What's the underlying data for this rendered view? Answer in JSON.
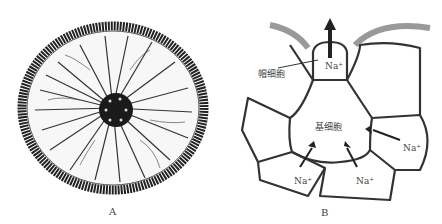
{
  "figure": {
    "panel_a": {
      "letter": "A",
      "description": "stem cross-section micrograph"
    },
    "panel_b": {
      "letter": "B",
      "labels": {
        "cap_cell": "帽细胞",
        "basal_cell": "基细胞",
        "na_top": "Na⁺",
        "na_right": "Na⁺",
        "na_bottom_left": "Na⁺",
        "na_bottom_right": "Na⁺"
      }
    }
  }
}
